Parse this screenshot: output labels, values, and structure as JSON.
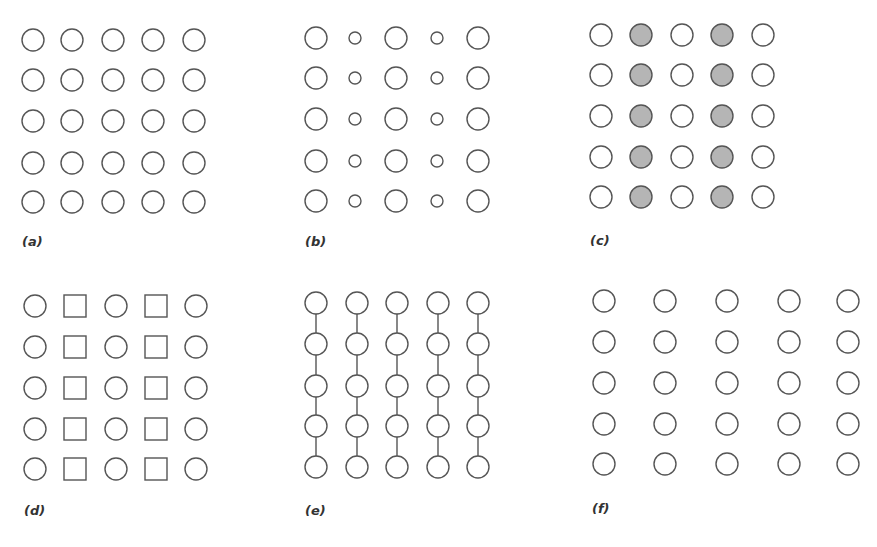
{
  "figure": {
    "stroke_color": "#555555",
    "fill_gray": "#b5b5b5",
    "background": "#ffffff",
    "panels": [
      {
        "id": "a",
        "label": "(a)",
        "label_pos": [
          22,
          246
        ],
        "xs": [
          33,
          72,
          113,
          153,
          194
        ],
        "ys": [
          40,
          80,
          121,
          163,
          202
        ],
        "cells": [
          "circle",
          "circle",
          "circle",
          "circle",
          "circle"
        ],
        "radius": [
          11,
          11,
          11,
          11,
          11
        ],
        "filled": [
          false,
          false,
          false,
          false,
          false
        ],
        "connect_columns": false
      },
      {
        "id": "b",
        "label": "(b)",
        "label_pos": [
          305,
          246
        ],
        "xs": [
          316,
          355,
          396,
          437,
          478
        ],
        "ys": [
          38,
          78,
          119,
          161,
          201
        ],
        "cells": [
          "circle",
          "circle",
          "circle",
          "circle",
          "circle"
        ],
        "radius": [
          11,
          6,
          11,
          6,
          11
        ],
        "filled": [
          false,
          false,
          false,
          false,
          false
        ],
        "connect_columns": false
      },
      {
        "id": "c",
        "label": "(c)",
        "label_pos": [
          590,
          245
        ],
        "xs": [
          601,
          641,
          682,
          722,
          763
        ],
        "ys": [
          35,
          75,
          116,
          157,
          197
        ],
        "cells": [
          "circle",
          "circle",
          "circle",
          "circle",
          "circle"
        ],
        "radius": [
          11,
          11,
          11,
          11,
          11
        ],
        "filled": [
          false,
          true,
          false,
          true,
          false
        ],
        "connect_columns": false
      },
      {
        "id": "d",
        "label": "(d)",
        "label_pos": [
          24,
          515
        ],
        "xs": [
          35,
          75,
          116,
          156,
          196
        ],
        "ys": [
          306,
          347,
          388,
          429,
          469
        ],
        "cells": [
          "circle",
          "square",
          "circle",
          "square",
          "circle"
        ],
        "radius": [
          11,
          11,
          11,
          11,
          11
        ],
        "filled": [
          false,
          false,
          false,
          false,
          false
        ],
        "connect_columns": false
      },
      {
        "id": "e",
        "label": "(e)",
        "label_pos": [
          305,
          515
        ],
        "xs": [
          316,
          357,
          397,
          438,
          478
        ],
        "ys": [
          303,
          344,
          386,
          426,
          467
        ],
        "cells": [
          "circle",
          "circle",
          "circle",
          "circle",
          "circle"
        ],
        "radius": [
          11,
          11,
          11,
          11,
          11
        ],
        "filled": [
          false,
          false,
          false,
          false,
          false
        ],
        "connect_columns": true
      },
      {
        "id": "f",
        "label": "(f)",
        "label_pos": [
          592,
          513
        ],
        "xs": [
          604,
          665,
          727,
          789,
          848
        ],
        "ys": [
          301,
          342,
          383,
          424,
          464
        ],
        "cells": [
          "circle",
          "circle",
          "circle",
          "circle",
          "circle"
        ],
        "radius": [
          11,
          11,
          11,
          11,
          11
        ],
        "filled": [
          false,
          false,
          false,
          false,
          false
        ],
        "connect_columns": false
      }
    ]
  }
}
